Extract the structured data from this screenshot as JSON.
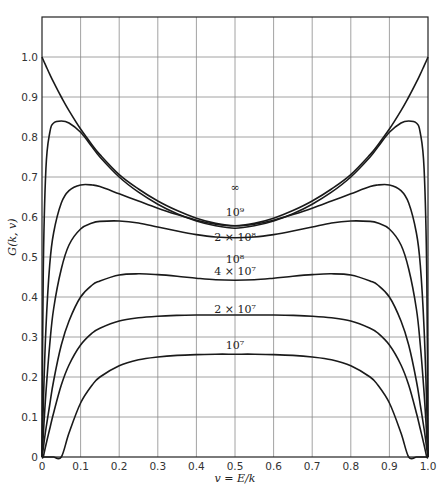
{
  "chart_data": {
    "type": "line",
    "title": "",
    "xlabel": "v = E/k",
    "ylabel": "G(k, v)",
    "xlim": [
      0,
      1.0
    ],
    "ylim": [
      0,
      1.1
    ],
    "grid": true,
    "legend_position": "inline curve labels",
    "x_ticks": [
      "0",
      "0.1",
      "0.2",
      "0.3",
      "0.4",
      "0.5",
      "0.6",
      "0.7",
      "0.8",
      "0.9",
      "1.0"
    ],
    "y_ticks": [
      "0",
      "0.1",
      "0.2",
      "0.3",
      "0.4",
      "0.5",
      "0.6",
      "0.7",
      "0.8",
      "0.9",
      "1.0"
    ],
    "x": [
      0,
      0.003,
      0.01,
      0.02,
      0.03,
      0.05,
      0.07,
      0.1,
      0.13,
      0.15,
      0.2,
      0.25,
      0.3,
      0.35,
      0.4,
      0.45,
      0.5,
      0.55,
      0.6,
      0.65,
      0.7,
      0.75,
      0.8,
      0.85,
      0.87,
      0.9,
      0.93,
      0.95,
      0.97,
      0.98,
      0.99,
      0.997,
      1.0
    ],
    "series": [
      {
        "name": "∞",
        "label_text": "∞",
        "label_pos": [
          0.5,
          0.675
        ],
        "values": [
          1.0,
          0.993,
          0.978,
          0.957,
          0.937,
          0.9,
          0.866,
          0.82,
          0.78,
          0.756,
          0.706,
          0.67,
          0.64,
          0.616,
          0.597,
          0.584,
          0.578,
          0.584,
          0.597,
          0.616,
          0.64,
          0.67,
          0.706,
          0.756,
          0.78,
          0.82,
          0.866,
          0.9,
          0.937,
          0.957,
          0.978,
          0.993,
          1.0
        ]
      },
      {
        "name": "1e9",
        "label_text": "10⁹",
        "label_pos": [
          0.5,
          0.612
        ],
        "values": [
          0,
          0.45,
          0.72,
          0.81,
          0.835,
          0.84,
          0.835,
          0.812,
          0.775,
          0.75,
          0.7,
          0.662,
          0.632,
          0.608,
          0.59,
          0.578,
          0.572,
          0.578,
          0.59,
          0.608,
          0.632,
          0.662,
          0.7,
          0.75,
          0.775,
          0.812,
          0.835,
          0.84,
          0.835,
          0.81,
          0.72,
          0.45,
          0
        ]
      },
      {
        "name": "2e8",
        "label_text": "2 × 10⁸",
        "label_pos": [
          0.5,
          0.55
        ],
        "values": [
          0,
          0.12,
          0.32,
          0.48,
          0.56,
          0.635,
          0.666,
          0.68,
          0.68,
          0.676,
          0.658,
          0.64,
          0.622,
          0.606,
          0.592,
          0.582,
          0.578,
          0.582,
          0.592,
          0.606,
          0.622,
          0.64,
          0.658,
          0.676,
          0.68,
          0.68,
          0.666,
          0.635,
          0.56,
          0.48,
          0.32,
          0.12,
          0
        ]
      },
      {
        "name": "1e8",
        "label_text": "10⁸",
        "label_pos": [
          0.5,
          0.495
        ],
        "values": [
          0,
          0.05,
          0.16,
          0.28,
          0.37,
          0.47,
          0.53,
          0.57,
          0.585,
          0.589,
          0.59,
          0.585,
          0.575,
          0.565,
          0.556,
          0.55,
          0.548,
          0.55,
          0.556,
          0.565,
          0.575,
          0.585,
          0.59,
          0.589,
          0.585,
          0.57,
          0.53,
          0.47,
          0.37,
          0.28,
          0.16,
          0.05,
          0
        ]
      },
      {
        "name": "4e7",
        "label_text": "4 × 10⁷",
        "label_pos": [
          0.5,
          0.465
        ],
        "values": [
          0,
          0.02,
          0.07,
          0.13,
          0.19,
          0.28,
          0.34,
          0.4,
          0.43,
          0.44,
          0.455,
          0.458,
          0.456,
          0.452,
          0.447,
          0.443,
          0.442,
          0.443,
          0.447,
          0.452,
          0.456,
          0.458,
          0.455,
          0.44,
          0.43,
          0.4,
          0.34,
          0.28,
          0.19,
          0.13,
          0.07,
          0.02,
          0
        ]
      },
      {
        "name": "2e7",
        "label_text": "2 × 10⁷",
        "label_pos": [
          0.5,
          0.37
        ],
        "values": [
          0,
          0,
          0.03,
          0.07,
          0.11,
          0.18,
          0.23,
          0.28,
          0.31,
          0.322,
          0.34,
          0.348,
          0.352,
          0.354,
          0.355,
          0.355,
          0.355,
          0.355,
          0.355,
          0.354,
          0.352,
          0.348,
          0.34,
          0.322,
          0.31,
          0.28,
          0.23,
          0.18,
          0.11,
          0.07,
          0.03,
          0,
          0
        ]
      },
      {
        "name": "1e7",
        "label_text": "10⁷",
        "label_pos": [
          0.5,
          0.28
        ],
        "values": [
          0,
          0,
          0,
          0,
          0,
          0,
          0.06,
          0.135,
          0.18,
          0.2,
          0.228,
          0.243,
          0.25,
          0.254,
          0.256,
          0.257,
          0.257,
          0.257,
          0.256,
          0.254,
          0.25,
          0.243,
          0.228,
          0.2,
          0.18,
          0.135,
          0.06,
          0,
          0,
          0,
          0,
          0,
          0
        ]
      }
    ]
  },
  "axes": {
    "xlabel": "v = E/k",
    "ylabel": "G(k, v)"
  }
}
